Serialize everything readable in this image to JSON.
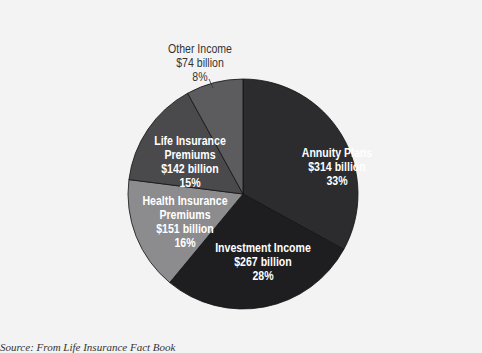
{
  "chart_data": {
    "type": "pie",
    "title": "",
    "center": [
      243,
      194
    ],
    "radius": 115,
    "start_angle_deg": -90,
    "slices": [
      {
        "name": "Annuity Plans",
        "amount": "$314 billion",
        "value": 314,
        "percent": 33,
        "pct_label": "33%",
        "color": "#2c2c2f"
      },
      {
        "name": "Investment Income",
        "amount": "$267 billion",
        "value": 267,
        "percent": 28,
        "pct_label": "28%",
        "color": "#1e1e21"
      },
      {
        "name": "Health Insurance Premiums",
        "amount": "$151 billion",
        "value": 151,
        "percent": 16,
        "pct_label": "16%",
        "color": "#8c8c8e"
      },
      {
        "name": "Life Insurance Premiums",
        "amount": "$142 billion",
        "value": 142,
        "percent": 15,
        "pct_label": "15%",
        "color": "#4a4a4d"
      },
      {
        "name": "Other Income",
        "amount": "$74 billion",
        "value": 74,
        "percent": 8,
        "pct_label": "8%",
        "color": "#5c5c5f"
      }
    ]
  },
  "labels": {
    "annuity": {
      "line1": "Annuity Plans",
      "line2": "$314 billion",
      "line3": "33%"
    },
    "investment": {
      "line1": "Investment Income",
      "line2": "$267 billion",
      "line3": "28%"
    },
    "health": {
      "line1": "Health Insurance",
      "line2": "Premiums",
      "line3": "$151 billion",
      "line4": "16%"
    },
    "life": {
      "line1": "Life Insurance",
      "line2": "Premiums",
      "line3": "$142 billion",
      "line4": "15%"
    },
    "other": {
      "line1": "Other Income",
      "line2": "$74 billion",
      "line3": "8%"
    }
  },
  "source": "Source: From Life Insurance Fact Book"
}
